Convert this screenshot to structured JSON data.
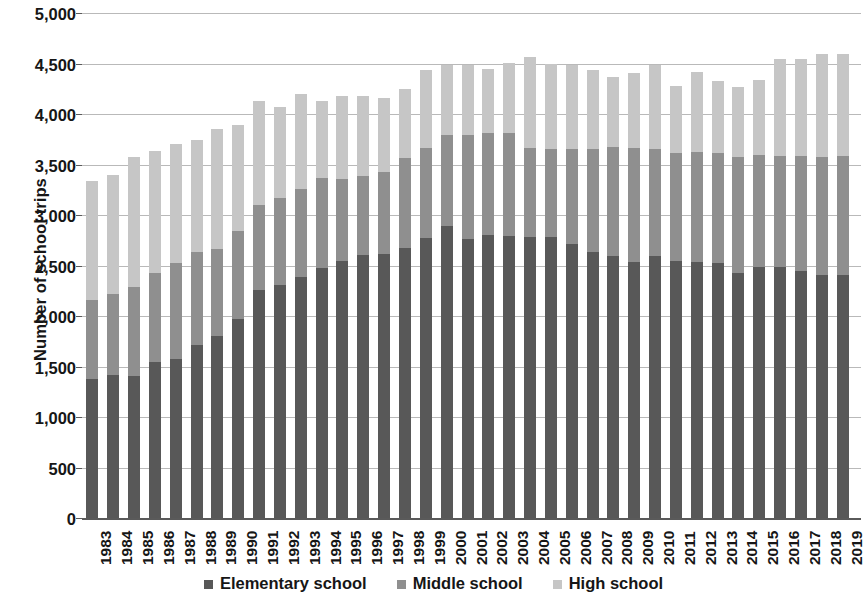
{
  "chart_data": {
    "type": "bar",
    "stacked": true,
    "title": "",
    "xlabel": "",
    "ylabel": "Number of school trips",
    "ylim": [
      0,
      5000
    ],
    "ytick_step": 500,
    "ytick_labels": [
      "5,000",
      "4,500",
      "4,000",
      "3,500",
      "3,000",
      "2,500",
      "2,000",
      "1,500",
      "1,000",
      "500",
      "0"
    ],
    "ytick_values": [
      5000,
      4500,
      4000,
      3500,
      3000,
      2500,
      2000,
      1500,
      1000,
      500,
      0
    ],
    "grid": true,
    "legend_position": "bottom",
    "categories": [
      "1983",
      "1984",
      "1985",
      "1986",
      "1987",
      "1988",
      "1989",
      "1990",
      "1991",
      "1992",
      "1993",
      "1994",
      "1995",
      "1996",
      "1997",
      "1998",
      "1999",
      "2000",
      "2001",
      "2002",
      "2003",
      "2004",
      "2005",
      "2006",
      "2007",
      "2008",
      "2009",
      "2010",
      "2011",
      "2012",
      "2013",
      "2014",
      "2015",
      "2016",
      "2017",
      "2018",
      "2019"
    ],
    "series": [
      {
        "name": "Elementary school",
        "color": "#585858",
        "values": [
          1385,
          1425,
          1420,
          1550,
          1580,
          1720,
          1810,
          1980,
          2270,
          2320,
          2400,
          2490,
          2550,
          2610,
          2620,
          2680,
          2780,
          2900,
          2770,
          2810,
          2800,
          2790,
          2790,
          2720,
          2640,
          2600,
          2540,
          2600,
          2550,
          2540,
          2530,
          2440,
          2500,
          2500,
          2460,
          2420,
          2420
        ]
      },
      {
        "name": "Middle school",
        "color": "#8f8f8f",
        "values": [
          780,
          800,
          880,
          890,
          950,
          920,
          860,
          870,
          840,
          860,
          870,
          890,
          820,
          790,
          820,
          890,
          890,
          900,
          1030,
          1010,
          1020,
          880,
          870,
          940,
          1020,
          1080,
          1130,
          1060,
          1070,
          1090,
          1090,
          1140,
          1100,
          1090,
          1130,
          1160,
          1170
        ]
      },
      {
        "name": "High school",
        "color": "#c6c6c6",
        "values": [
          1185,
          1185,
          1280,
          1200,
          1180,
          1110,
          1190,
          1050,
          1030,
          900,
          940,
          760,
          820,
          790,
          730,
          690,
          780,
          700,
          700,
          640,
          700,
          900,
          850,
          840,
          790,
          700,
          750,
          840,
          670,
          800,
          720,
          700,
          750,
          960,
          960,
          1020,
          1010
        ]
      }
    ],
    "totals": [
      3350,
      3410,
      3580,
      3640,
      3710,
      3750,
      3860,
      3900,
      4140,
      4080,
      4210,
      4140,
      4190,
      4190,
      4170,
      4260,
      4450,
      4500,
      4500,
      4460,
      4520,
      4570,
      4510,
      4500,
      4450,
      4380,
      4420,
      4500,
      4290,
      4430,
      4340,
      4280,
      4350,
      4550,
      4550,
      4600,
      4600
    ]
  },
  "legend": {
    "items": [
      {
        "label": "Elementary school",
        "color": "#585858"
      },
      {
        "label": "Middle school",
        "color": "#8f8f8f"
      },
      {
        "label": "High school",
        "color": "#c6c6c6"
      }
    ]
  }
}
